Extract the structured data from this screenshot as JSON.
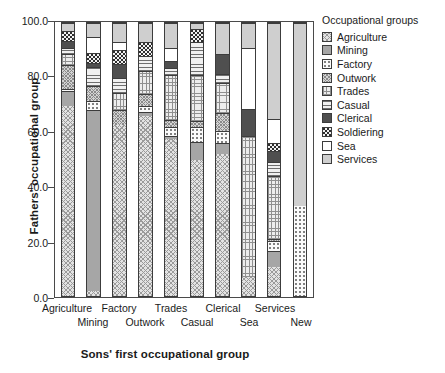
{
  "chart_data": {
    "type": "bar",
    "stacked": true,
    "stack_total": 100,
    "title": "",
    "xlabel": "Sons' first occupational group",
    "ylabel": "Fathers' occupational group",
    "ylim": [
      0,
      100
    ],
    "yticks": [
      "0.0",
      "20.0",
      "40.0",
      "60.0",
      "80.0",
      "100.0"
    ],
    "ytick_values": [
      0,
      20,
      40,
      60,
      80,
      100
    ],
    "grid": false,
    "legend_position": "right",
    "legend_title": "Occupational groups",
    "categories": [
      "Agriculture",
      "Mining",
      "Factory",
      "Outwork",
      "Trades",
      "Casual",
      "Clerical",
      "Sea",
      "Services",
      "New"
    ],
    "series": [
      {
        "name": "Agriculture",
        "values": [
          69.5,
          2.0,
          62.5,
          66.0,
          57.5,
          50.0,
          52.0,
          7.0,
          10.5,
          0.0
        ]
      },
      {
        "name": "Mining",
        "values": [
          5.5,
          66.0,
          0.0,
          1.5,
          1.0,
          6.5,
          4.0,
          0.0,
          6.0,
          0.0
        ]
      },
      {
        "name": "Factory",
        "values": [
          1.0,
          3.5,
          0.0,
          2.0,
          3.5,
          5.5,
          4.5,
          0.0,
          3.5,
          33.0
        ]
      },
      {
        "name": "Outwork",
        "values": [
          8.5,
          5.5,
          5.5,
          4.5,
          2.5,
          2.0,
          6.5,
          0.0,
          1.0,
          0.0
        ]
      },
      {
        "name": "Trades",
        "values": [
          4.0,
          0.0,
          6.5,
          8.5,
          16.5,
          17.0,
          11.0,
          51.5,
          23.0,
          0.0
        ]
      },
      {
        "name": "Casual",
        "values": [
          2.5,
          7.0,
          5.5,
          5.5,
          2.5,
          12.0,
          3.5,
          0.0,
          5.0,
          0.0
        ]
      },
      {
        "name": "Clerical",
        "values": [
          2.5,
          1.5,
          5.0,
          0.0,
          2.5,
          0.0,
          7.0,
          10.0,
          4.0,
          0.0
        ]
      },
      {
        "name": "Soldiering",
        "values": [
          3.5,
          3.5,
          5.0,
          5.0,
          0.0,
          5.0,
          0.0,
          0.0,
          3.0,
          0.0
        ]
      },
      {
        "name": "Sea",
        "values": [
          0.0,
          6.0,
          3.0,
          0.0,
          5.0,
          0.0,
          0.0,
          22.5,
          9.0,
          0.0
        ]
      },
      {
        "name": "Services",
        "values": [
          3.0,
          5.0,
          7.0,
          7.0,
          9.0,
          2.0,
          11.5,
          9.0,
          35.0,
          67.0
        ]
      }
    ],
    "legend_entries": [
      {
        "label": "Agriculture",
        "pattern": "light-grey-diagonal-crosshatch"
      },
      {
        "label": "Mining",
        "pattern": "solid-medium-grey"
      },
      {
        "label": "Factory",
        "pattern": "white-sparse-dots"
      },
      {
        "label": "Outwork",
        "pattern": "grey-fine-crosshatch"
      },
      {
        "label": "Trades",
        "pattern": "light-grey-square-grid"
      },
      {
        "label": "Casual",
        "pattern": "horizontal-lines"
      },
      {
        "label": "Clerical",
        "pattern": "solid-dark-grey"
      },
      {
        "label": "Soldiering",
        "pattern": "dark-checkerboard"
      },
      {
        "label": "Sea",
        "pattern": "white-plain"
      },
      {
        "label": "Services",
        "pattern": "light-grey-plain"
      }
    ],
    "xtick_rows": {
      "upper": [
        "Agriculture",
        "Factory",
        "Trades",
        "Clerical",
        "Services"
      ],
      "lower": [
        "Mining",
        "Outwork",
        "Casual",
        "Sea",
        "New"
      ]
    }
  }
}
